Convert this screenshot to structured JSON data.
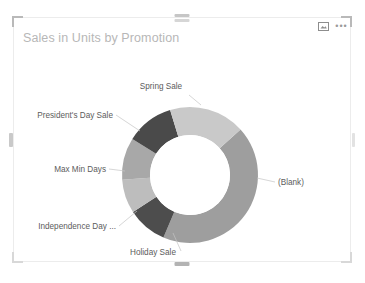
{
  "visual": {
    "title": "Sales in Units by Promotion",
    "header_icons": [
      {
        "name": "focus-mode-icon",
        "label": "Focus mode"
      },
      {
        "name": "more-options-icon",
        "label": "More options"
      }
    ]
  },
  "chart_data": {
    "type": "pie",
    "variant": "donut",
    "title": "Sales in Units by Promotion",
    "xlabel": "",
    "ylabel": "Sales in Units",
    "legend": "none",
    "grid": false,
    "labels_position": "outside",
    "categories": [
      "(Blank)",
      "Spring Sale",
      "President's Day Sale",
      "Max Min Days",
      "Independence Day ...",
      "Holiday Sale"
    ],
    "slices": [
      {
        "label": "(Blank)",
        "percent": 43.0,
        "color": "#9e9e9e",
        "start_angle": 48,
        "end_angle": 203
      },
      {
        "label": "Holiday Sale",
        "percent": 9.5,
        "color": "#4d4d4d",
        "start_angle": 203,
        "end_angle": 237
      },
      {
        "label": "Independence Day ...",
        "percent": 8.0,
        "color": "#bdbdbd",
        "start_angle": 237,
        "end_angle": 266
      },
      {
        "label": "Max Min Days",
        "percent": 10.0,
        "color": "#a8a8a8",
        "start_angle": 266,
        "end_angle": 302
      },
      {
        "label": "President's Day Sale",
        "percent": 11.5,
        "color": "#4a4a4a",
        "start_angle": 302,
        "end_angle": 343
      },
      {
        "label": "Spring Sale",
        "percent": 18.0,
        "color": "#c9c9c9",
        "start_angle": 343,
        "end_angle": 408
      }
    ],
    "values": [
      43.0,
      9.5,
      8.0,
      10.0,
      11.5,
      18.0
    ],
    "colors": [
      "#9e9e9e",
      "#4d4d4d",
      "#bdbdbd",
      "#a8a8a8",
      "#4a4a4a",
      "#c9c9c9"
    ]
  },
  "labels": {
    "blank": {
      "text": "(Blank)",
      "x": 265,
      "y": 138,
      "anchor": "start"
    },
    "spring": {
      "text": "Spring Sale",
      "x": 148,
      "y": 42,
      "anchor": "middle"
    },
    "presidents": {
      "text": "President's Day Sale",
      "x": 100,
      "y": 71,
      "anchor": "end"
    },
    "maxmin": {
      "text": "Max Min Days",
      "x": 93,
      "y": 125,
      "anchor": "end"
    },
    "independence": {
      "text": "Independence Day ...",
      "x": 103,
      "y": 182,
      "anchor": "end"
    },
    "holiday": {
      "text": "Holiday Sale",
      "x": 140,
      "y": 208,
      "anchor": "middle"
    }
  }
}
